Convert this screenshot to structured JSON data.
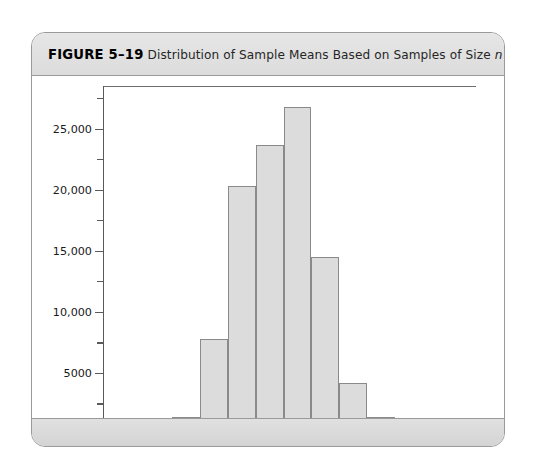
{
  "figure": {
    "label": "FIGURE 5–19",
    "caption_part1": "Distribution of Sample Means Based on Samples of Size ",
    "caption_italic": "n",
    "caption_part2": " = 10"
  },
  "colors": {
    "bar_fill": "#dcdcdc",
    "bar_stroke": "#8a8a8a",
    "axis": "#5a5a5a",
    "header_band": "#e0e0e0",
    "card_border": "#9a9a9a"
  },
  "chart_data": {
    "type": "bar",
    "title": "Distribution of Sample Means Based on Samples of Size n = 10",
    "xlabel": "",
    "ylabel": "",
    "xlim": [
      2.75,
      9.5
    ],
    "ylim": [
      0,
      28500
    ],
    "grid": false,
    "legend": null,
    "bin_width": 0.5,
    "bin_edges": [
      3.5,
      4.0,
      4.5,
      5.0,
      5.5,
      6.0,
      6.5,
      7.0,
      7.5,
      8.0,
      8.5
    ],
    "categories": [
      "3.5–4.0",
      "4.0–4.5",
      "4.5–5.0",
      "5.0–5.5",
      "5.5–6.0",
      "6.0–6.5",
      "6.5–7.0",
      "7.0–7.5",
      "7.5–8.0",
      "8.0–8.5"
    ],
    "values": [
      400,
      1400,
      7800,
      20300,
      23700,
      26800,
      14500,
      4200,
      1400,
      500
    ],
    "x_ticks_major": [
      3.0,
      4.0,
      5.0,
      6.0,
      7.0,
      8.0,
      9.0
    ],
    "x_tick_labels": [
      "3.0",
      "4.0",
      "5.0",
      "6.0",
      "7.0",
      "8.0",
      "9.0"
    ],
    "x_ticks_minor": [
      2.75,
      3.25,
      3.5,
      3.75,
      4.25,
      4.5,
      4.75,
      5.25,
      5.5,
      5.75,
      6.25,
      6.5,
      6.75,
      7.25,
      7.5,
      7.75,
      8.25,
      8.5,
      8.75,
      9.25
    ],
    "y_ticks_major": [
      0,
      5000,
      10000,
      15000,
      20000,
      25000
    ],
    "y_tick_labels": [
      "0",
      "5000",
      "10,000",
      "15,000",
      "20,000",
      "25,000"
    ],
    "y_ticks_minor": [
      2500,
      7500,
      12500,
      17500,
      22500,
      27500
    ]
  }
}
